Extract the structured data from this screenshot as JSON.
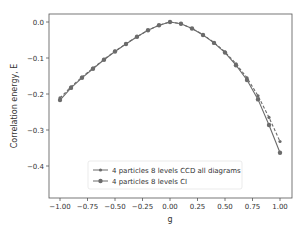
{
  "chart_data": {
    "type": "line",
    "title": "",
    "xlabel": "g",
    "ylabel": "Correlation energy, E",
    "xlim": [
      -1.1,
      1.1
    ],
    "ylim": [
      -0.49,
      0.022
    ],
    "grid": false,
    "legend_position": "lower center",
    "x_ticks": [
      -1.0,
      -0.75,
      -0.5,
      -0.25,
      0.0,
      0.25,
      0.5,
      0.75,
      1.0
    ],
    "x_tick_labels": [
      "−1.00",
      "−0.75",
      "−0.50",
      "−0.25",
      "0.00",
      "0.25",
      "0.50",
      "0.75",
      "1.00"
    ],
    "y_ticks": [
      0.0,
      -0.1,
      -0.2,
      -0.3,
      -0.4
    ],
    "y_tick_labels": [
      "0.0",
      "−0.1",
      "−0.2",
      "−0.3",
      "−0.4"
    ],
    "x": [
      -1.0,
      -0.9,
      -0.8,
      -0.7,
      -0.6,
      -0.5,
      -0.4,
      -0.3,
      -0.2,
      -0.1,
      0.0,
      0.1,
      0.2,
      0.3,
      0.4,
      0.5,
      0.6,
      0.7,
      0.8,
      0.9,
      1.0
    ],
    "series": [
      {
        "name": "4 particles 8 levels CCD all diagrams",
        "style": "dashed",
        "marker": "small-dot",
        "color": "#6b6b6b",
        "values": [
          -0.211,
          -0.18,
          -0.153,
          -0.128,
          -0.104,
          -0.081,
          -0.06,
          -0.041,
          -0.023,
          -0.009,
          0.0,
          -0.005,
          -0.018,
          -0.035,
          -0.057,
          -0.083,
          -0.116,
          -0.155,
          -0.205,
          -0.265,
          -0.332
        ]
      },
      {
        "name": "4 particles 8 levels CI",
        "style": "solid",
        "marker": "dot",
        "color": "#6b6b6b",
        "values": [
          -0.217,
          -0.183,
          -0.155,
          -0.13,
          -0.105,
          -0.082,
          -0.061,
          -0.041,
          -0.023,
          -0.009,
          0.0,
          -0.005,
          -0.018,
          -0.036,
          -0.058,
          -0.085,
          -0.12,
          -0.161,
          -0.215,
          -0.286,
          -0.363
        ]
      }
    ]
  }
}
